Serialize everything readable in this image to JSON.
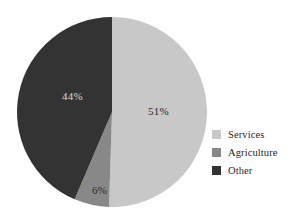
{
  "chart_data": {
    "type": "pie",
    "title": "",
    "subtitle": "",
    "xlabel": "",
    "ylabel": "",
    "grid": false,
    "legend_position": "right",
    "start_angle_deg": 0,
    "direction": "clockwise",
    "categories": [
      "Services",
      "Agriculture",
      "Other"
    ],
    "values": [
      51,
      6,
      44
    ],
    "unit": "%",
    "data_labels": [
      "51%",
      "6%",
      "44%"
    ],
    "colors": [
      "#c8c8c8",
      "#888888",
      "#333333"
    ],
    "slices": [
      {
        "name": "Services",
        "value": 51,
        "label": "51%",
        "color": "#c8c8c8",
        "label_color": "#2b2b2b",
        "label_x": 148,
        "label_y": 105
      },
      {
        "name": "Agriculture",
        "value": 6,
        "label": "6%",
        "color": "#888888",
        "label_color": "#2b2b2b",
        "label_x": 92,
        "label_y": 184
      },
      {
        "name": "Other",
        "value": 44,
        "label": "44%",
        "color": "#333333",
        "label_color": "#d9d9d9",
        "label_x": 62,
        "label_y": 90
      }
    ]
  },
  "pie": {
    "center_x": 112,
    "center_y": 112,
    "radius": 95
  },
  "legend": {
    "items": [
      {
        "label": "Services",
        "color": "#c8c8c8"
      },
      {
        "label": "Agriculture",
        "color": "#888888"
      },
      {
        "label": "Other",
        "color": "#333333"
      }
    ]
  },
  "canvas": {
    "background": "#ffffff",
    "width": 291,
    "height": 224
  }
}
